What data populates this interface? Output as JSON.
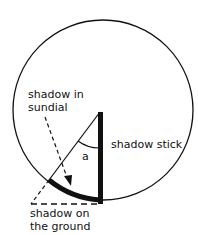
{
  "labels": {
    "shadow_in_sundial_1": "shadow in",
    "shadow_in_sundial_2": "sundial",
    "angle": "a",
    "shadow_stick": "shadow stick",
    "shadow_ground_1": "shadow on",
    "shadow_ground_2": "the ground"
  },
  "colors": {
    "stroke": "#111111",
    "background": "#ffffff"
  }
}
